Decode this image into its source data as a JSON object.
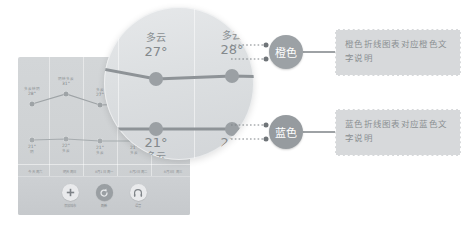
{
  "weather_card": {
    "series": [
      {
        "name": "high-temp-line",
        "color_label": "橙色",
        "points": [
          {
            "condition": "多云转阴",
            "temp": "28°",
            "x": 14,
            "y": 47
          },
          {
            "condition": "阴转多云",
            "temp": "31°",
            "x": 48,
            "y": 37
          },
          {
            "condition": "多云",
            "temp": "27°",
            "x": 82,
            "y": 48
          },
          {
            "condition": "多云",
            "temp": "28°",
            "x": 116,
            "y": 47
          },
          {
            "condition": "多云",
            "temp": "27°",
            "x": 150,
            "y": 48
          }
        ]
      },
      {
        "name": "low-temp-line",
        "color_label": "蓝色",
        "points": [
          {
            "condition": "阴",
            "temp": "21°",
            "x": 14,
            "y": 83
          },
          {
            "condition": "多云",
            "temp": "22°",
            "x": 48,
            "y": 82
          },
          {
            "condition": "多云",
            "temp": "21°",
            "x": 82,
            "y": 84
          },
          {
            "condition": "多云",
            "temp": "21°",
            "x": 116,
            "y": 84
          },
          {
            "condition": "多云",
            "temp": "21°",
            "x": 150,
            "y": 84
          }
        ]
      }
    ],
    "days": [
      "今天 周六",
      "明天 周日",
      "8月1日 周一",
      "8月2日 周二",
      "8月3日 周三"
    ],
    "toolbar": [
      {
        "icon": "plus-icon",
        "label": "添加城市",
        "active": false
      },
      {
        "icon": "refresh-icon",
        "label": "刷新",
        "active": true
      },
      {
        "icon": "headphone-icon",
        "label": "语音",
        "active": false
      }
    ]
  },
  "magnifier": {
    "top_points": [
      {
        "condition": "多云",
        "temp": "27°",
        "cx": 52,
        "cy": 72
      },
      {
        "condition": "多云",
        "temp": "28°",
        "cx": 128,
        "cy": 69
      }
    ],
    "bottom_points": [
      {
        "condition": "多云",
        "temp": "21°",
        "cx": 52,
        "cy": 122
      },
      {
        "condition": "多云",
        "temp": "21°",
        "cx": 128,
        "cy": 122
      }
    ]
  },
  "annotations": [
    {
      "badge_label": "橙色",
      "badge_color": "#9ca1a5",
      "description": "橙色折线图表对应橙色文字说明"
    },
    {
      "badge_label": "蓝色",
      "badge_color": "#969b9f",
      "description": "蓝色折线图表对应蓝色文字说明"
    }
  ]
}
